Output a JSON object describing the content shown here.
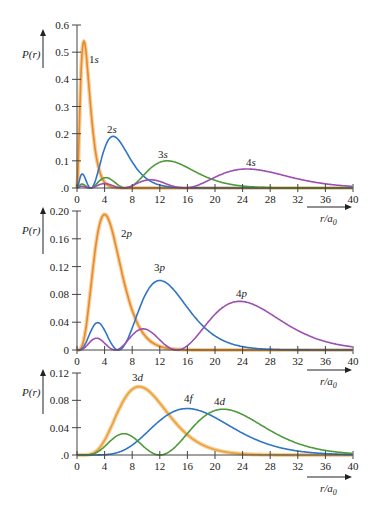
{
  "chart_data": [
    {
      "type": "line",
      "title": "",
      "ylabel": "P(r)",
      "xlabel": "r/a0",
      "xlim": [
        0,
        40
      ],
      "ylim": [
        0,
        0.6
      ],
      "xticks": [
        "0",
        "4",
        "8",
        "12",
        "16",
        "20",
        "24",
        "28",
        "32",
        "36",
        "40"
      ],
      "yticks": [
        ".0",
        "0.1",
        "0.2",
        "0.3",
        "0.4",
        "0.5",
        "0.6"
      ],
      "grid": false,
      "series": [
        {
          "name": "1s",
          "color": "#e8892a",
          "peak": {
            "x": 1,
            "y": 0.54
          }
        },
        {
          "name": "2s",
          "color": "#2f74c7",
          "peak": {
            "x": 5.2,
            "y": 0.19
          }
        },
        {
          "name": "3s",
          "color": "#4d9a3a",
          "peak": {
            "x": 13.1,
            "y": 0.1
          }
        },
        {
          "name": "4s",
          "color": "#9b4fb0",
          "peak": {
            "x": 25.5,
            "y": 0.07
          }
        }
      ]
    },
    {
      "type": "line",
      "ylabel": "P(r)",
      "xlabel": "r/a0",
      "xlim": [
        0,
        40
      ],
      "ylim": [
        0,
        0.2
      ],
      "xticks": [
        "0",
        "4",
        "8",
        "12",
        "16",
        "20",
        "24",
        "28",
        "32",
        "36",
        "40"
      ],
      "yticks": [
        "0",
        "0.04",
        "0.08",
        "0.12",
        "0.16",
        "0.20"
      ],
      "grid": false,
      "series": [
        {
          "name": "2p",
          "color": "#e8892a",
          "peak": {
            "x": 4,
            "y": 0.195
          }
        },
        {
          "name": "3p",
          "color": "#2f74c7",
          "peak": {
            "x": 12,
            "y": 0.1
          }
        },
        {
          "name": "4p",
          "color": "#9b4fb0",
          "peak": {
            "x": 24,
            "y": 0.07
          }
        }
      ]
    },
    {
      "type": "line",
      "ylabel": "P(r)",
      "xlabel": "r/a0",
      "xlim": [
        0,
        40
      ],
      "ylim": [
        0,
        0.12
      ],
      "xticks": [
        "0",
        "4",
        "8",
        "12",
        "16",
        "20",
        "24",
        "28",
        "32",
        "36",
        "40"
      ],
      "yticks": [
        ".0",
        "0.04",
        "0.08",
        "0.12"
      ],
      "grid": false,
      "series": [
        {
          "name": "3d",
          "color": "#e8a33a",
          "peak": {
            "x": 9,
            "y": 0.1
          }
        },
        {
          "name": "4f",
          "color": "#2f74c7",
          "peak": {
            "x": 16,
            "y": 0.068
          }
        },
        {
          "name": "4d",
          "color": "#4d9a3a",
          "peak": {
            "x": 20.5,
            "y": 0.067
          }
        }
      ]
    }
  ],
  "labels": {
    "panel1": {
      "ylabel": "P(r)",
      "xlabel": "r/a",
      "xsub": "0",
      "s1_num": "1",
      "s1": "s",
      "s2_num": "2",
      "s2": "s",
      "s3_num": "3",
      "s3": "s",
      "s4_num": "4",
      "s4": "s"
    },
    "panel2": {
      "ylabel": "P(r)",
      "xlabel": "r/a",
      "xsub": "0",
      "p2_num": "2",
      "p2": "p",
      "p3_num": "3",
      "p3": "p",
      "p4_num": "4",
      "p4": "p"
    },
    "panel3": {
      "ylabel": "P(r)",
      "xlabel": "r/a",
      "xsub": "0",
      "d3_num": "3",
      "d3": "d",
      "f4_num": "4",
      "f4": "f",
      "d4_num": "4",
      "d4": "d"
    }
  }
}
